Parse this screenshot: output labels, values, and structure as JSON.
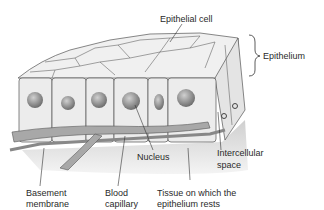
{
  "diagram": {
    "title_label": "Epithelial cell",
    "epithelium_label": "Epithelium",
    "labels": {
      "basement_membrane": [
        "Basement",
        "membrane"
      ],
      "blood_capillary": [
        "Blood",
        "capillary"
      ],
      "nucleus": "Nucleus",
      "tissue": [
        "Tissue on which the",
        "epithelium rests"
      ],
      "intercellular_space": [
        "Intercellular",
        "space"
      ]
    },
    "colors": {
      "cell_fill": "#ececec",
      "cell_stroke": "#555555",
      "nucleus": "#8a8a8a",
      "membrane": "#9a9a9a",
      "tissue": "#d8d8d8"
    }
  }
}
